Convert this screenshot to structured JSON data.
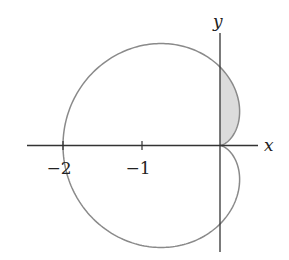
{
  "chart_data": {
    "type": "line",
    "title": "",
    "curve": "r = 1 - cos(theta)",
    "xlabel": "x",
    "ylabel": "y",
    "x_ticks": [
      -2,
      -1
    ],
    "x_tick_labels": [
      "−2",
      "−1"
    ],
    "xlim": [
      -2.5,
      0.5
    ],
    "ylim": [
      -1.35,
      1.45
    ],
    "grid": false,
    "legend": null,
    "key_points": [
      {
        "x": -2,
        "y": 0
      },
      {
        "x": 0,
        "y": 0
      },
      {
        "x": 0,
        "y": 1
      },
      {
        "x": 0,
        "y": -1
      },
      {
        "x": -0.75,
        "y": 1.299
      },
      {
        "x": -0.75,
        "y": -1.299
      },
      {
        "x": 0.25,
        "y": 0.433
      },
      {
        "x": 0.25,
        "y": -0.433
      }
    ],
    "shaded_region": {
      "description": "Part of cardioid interior with x >= 0, y >= 0 (theta from 0 to pi/2)",
      "theta_range": [
        0,
        1.5708
      ],
      "fill": "#dcdcdc"
    },
    "colors": {
      "curve": "#8a8a8a",
      "axes": "#333333",
      "shade": "#dcdcdc"
    }
  },
  "labels": {
    "x_axis": "x",
    "y_axis": "y",
    "tick_neg2": "−2",
    "tick_neg1": "−1"
  }
}
